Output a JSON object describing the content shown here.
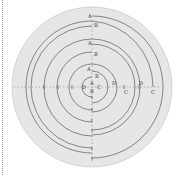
{
  "diagram": {
    "title": "",
    "colors": {
      "disc": "#e6e6e6",
      "stroke": "#5a5a5a",
      "text": "#333333"
    },
    "labels": {
      "outer": {
        "a": "A",
        "b": "B",
        "c": "C",
        "d": "D"
      },
      "middle": {
        "a": "A",
        "b": "B",
        "c": "C",
        "d": "D"
      },
      "inner": {
        "a": "A",
        "b": "B",
        "c": "C",
        "d": "D"
      },
      "center": {
        "a": "A",
        "b": "B",
        "c": "C",
        "d": "D"
      }
    }
  }
}
